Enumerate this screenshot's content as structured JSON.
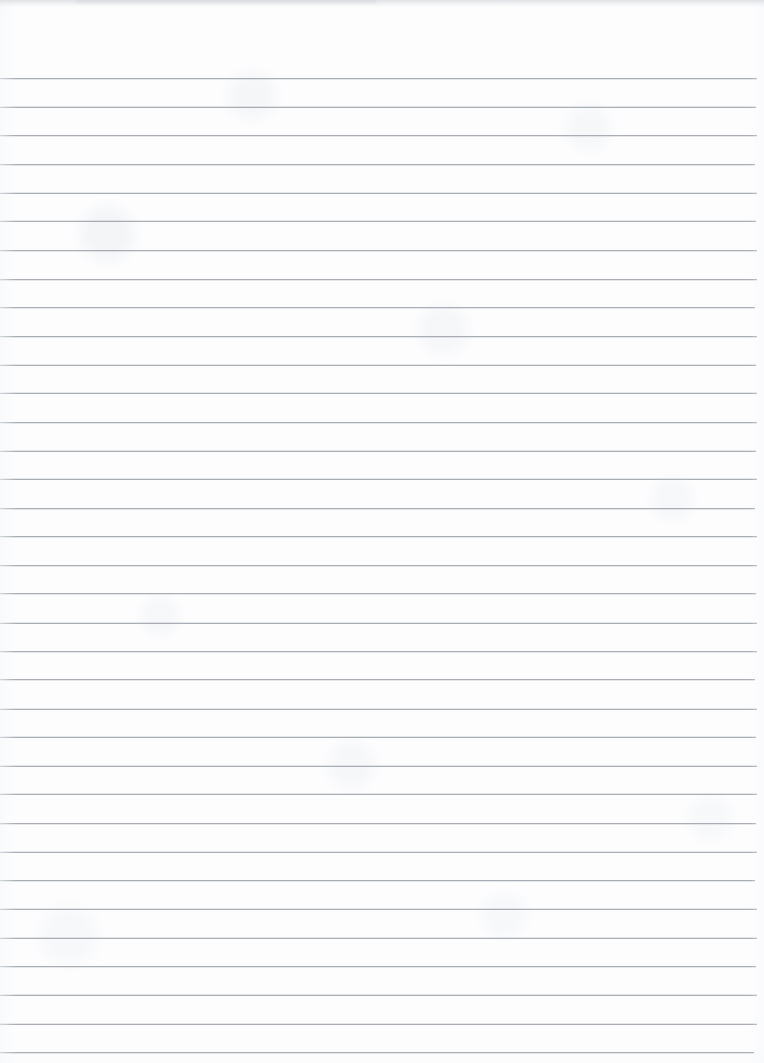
{
  "document": {
    "kind": "scanned-ruled-notebook-page",
    "title": "Blank Lined Notebook Page",
    "content_text": "",
    "has_handwriting": false,
    "page_width_px": 764,
    "page_height_px": 1063
  },
  "paper": {
    "background_color": "#fcfcfd",
    "edge_tint_color": "#f6f7f9",
    "top_shadow_color": "#cdd0d4"
  },
  "ruling": {
    "line_color": "#9ba1a9",
    "line_thickness_px": 1,
    "line_opacity": 0.85,
    "first_line_y_px": 78,
    "line_spacing_px": 28.65,
    "line_count": 35,
    "line_start_x_px": 0,
    "line_end_x_px": 757,
    "right_margin_px": 7,
    "left_margin_rule": false,
    "line_jitter_px": [
      0,
      0.3,
      -0.2,
      0.4,
      0,
      -0.3,
      0.2,
      0.5,
      -0.1,
      0.3,
      0,
      -0.4,
      0.2,
      0.1,
      -0.2,
      0.4,
      0,
      0.3,
      -0.3,
      0.2,
      0.1,
      -0.2,
      0.4,
      0,
      0.2,
      -0.3,
      0.1,
      0.3,
      -0.2,
      0,
      0.4,
      0.1,
      -0.2,
      0.3,
      0
    ],
    "line_width_jitter_px": [
      0,
      -1,
      0,
      -2,
      0,
      -1,
      0,
      0,
      -2,
      0,
      -1,
      0,
      0,
      -1,
      0,
      -2,
      0,
      0,
      -1,
      0,
      0,
      -2,
      0,
      -1,
      0,
      0,
      -1,
      0,
      -2,
      0,
      0,
      -1,
      0,
      0,
      -3
    ]
  }
}
